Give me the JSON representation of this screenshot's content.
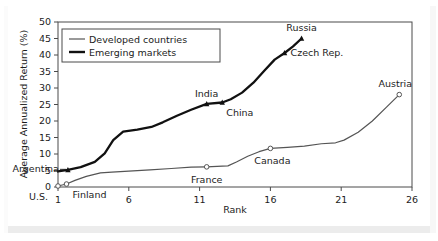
{
  "chart_data": {
    "type": "line",
    "title": "",
    "xlabel": "Rank",
    "ylabel": "Average Annualized Return (%)",
    "xlim": [
      1,
      26
    ],
    "ylim": [
      0,
      50
    ],
    "xticks": [
      1,
      6,
      11,
      16,
      21,
      26
    ],
    "yticks": [
      0,
      5,
      10,
      15,
      20,
      25,
      30,
      35,
      40,
      45,
      50
    ],
    "grid": false,
    "legend_position": "top-left",
    "series": [
      {
        "name": "Developed countries",
        "style": "thin",
        "marker": "open-circle",
        "x": [
          1,
          1.6,
          2.2,
          3.0,
          4.0,
          4.8,
          6.0,
          7.5,
          9.0,
          10.4,
          11.5,
          12.6,
          13.0,
          13.6,
          14.4,
          15.2,
          16.0,
          17.2,
          18.4,
          19.6,
          20.6,
          21.2,
          22.2,
          23.2,
          24.2,
          25.1
        ],
        "y": [
          0.3,
          0.9,
          2.0,
          3.2,
          4.3,
          4.5,
          4.8,
          5.2,
          5.6,
          6.0,
          6.1,
          6.3,
          6.4,
          7.6,
          9.3,
          10.7,
          11.7,
          12.0,
          12.4,
          13.1,
          13.4,
          14.2,
          16.6,
          20.0,
          24.2,
          28.0
        ]
      },
      {
        "name": "Emerging markets",
        "style": "thick",
        "marker": "filled-triangle",
        "x": [
          1,
          1.7,
          2.6,
          3.6,
          4.3,
          4.9,
          5.6,
          6.6,
          7.6,
          8.4,
          9.4,
          10.4,
          11.5,
          12.6,
          13.2,
          14.0,
          14.8,
          15.6,
          16.3,
          17.0,
          17.6,
          18.2
        ],
        "y": [
          4.7,
          5.2,
          6.0,
          7.6,
          10.2,
          14.2,
          16.8,
          17.4,
          18.2,
          19.6,
          21.6,
          23.4,
          25.2,
          25.6,
          26.6,
          28.6,
          31.6,
          35.4,
          38.6,
          40.6,
          42.6,
          45.0
        ]
      }
    ],
    "annotations": [
      {
        "label": "U.S.",
        "series": "Developed countries",
        "x": 1,
        "y": 0.3,
        "marker": "open-circle"
      },
      {
        "label": "Finland",
        "series": "Developed countries",
        "x": 1.6,
        "y": 0.9,
        "marker": "open-circle"
      },
      {
        "label": "France",
        "series": "Developed countries",
        "x": 11.5,
        "y": 6.1,
        "marker": "open-circle"
      },
      {
        "label": "Canada",
        "series": "Developed countries",
        "x": 16.0,
        "y": 11.7,
        "marker": "open-circle"
      },
      {
        "label": "Austria",
        "series": "Developed countries",
        "x": 25.1,
        "y": 28.0,
        "marker": "open-circle"
      },
      {
        "label": "Argentina",
        "series": "Emerging markets",
        "x": 1.7,
        "y": 5.2,
        "marker": "filled-triangle"
      },
      {
        "label": "India",
        "series": "Emerging markets",
        "x": 11.5,
        "y": 25.2,
        "marker": "filled-triangle"
      },
      {
        "label": "China",
        "series": "Emerging markets",
        "x": 12.6,
        "y": 25.6,
        "marker": "filled-triangle"
      },
      {
        "label": "Czech Rep.",
        "series": "Emerging markets",
        "x": 17.0,
        "y": 40.6,
        "marker": "filled-triangle"
      },
      {
        "label": "Russia",
        "series": "Emerging markets",
        "x": 18.2,
        "y": 45.0,
        "marker": "filled-triangle"
      }
    ],
    "colors": {
      "developed_line": "#555555",
      "emerging_line": "#111111",
      "axis": "#444444",
      "text": "#1c1c1c",
      "background": "#ffffff"
    }
  },
  "axis": {
    "y_label": "Average Annualized Return (%)",
    "x_label": "Rank",
    "y_ticks": [
      "0",
      "5",
      "10",
      "15",
      "20",
      "25",
      "30",
      "35",
      "40",
      "45",
      "50"
    ],
    "x_ticks": [
      "1",
      "6",
      "11",
      "16",
      "21",
      "26"
    ]
  },
  "legend": {
    "entries": [
      {
        "label": "Developed countries"
      },
      {
        "label": "Emerging markets"
      }
    ]
  },
  "labels": {
    "us": "U.S.",
    "finland": "Finland",
    "france": "France",
    "canada": "Canada",
    "austria": "Austria",
    "argentina": "Argentina",
    "india": "India",
    "china": "China",
    "czech": "Czech Rep.",
    "russia": "Russia"
  }
}
